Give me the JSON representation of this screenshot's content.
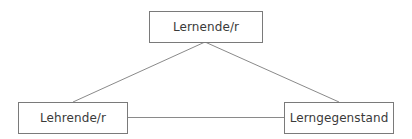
{
  "diagram": {
    "type": "triangle",
    "nodes": [
      {
        "id": "top",
        "label": "Lernende/r"
      },
      {
        "id": "left",
        "label": "Lehrende/r"
      },
      {
        "id": "right",
        "label": "Lerngegenstand"
      }
    ],
    "edges": [
      {
        "from": "top",
        "to": "left"
      },
      {
        "from": "top",
        "to": "right"
      },
      {
        "from": "left",
        "to": "right"
      }
    ],
    "colors": {
      "line": "#8a8a8a",
      "border": "#7a7a7a",
      "text": "#3a3a3a",
      "background": "#ffffff"
    }
  }
}
